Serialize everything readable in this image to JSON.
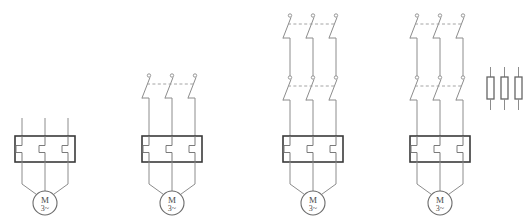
{
  "diagram": {
    "type": "electrical-schematic",
    "background_color": "#ffffff",
    "wire_color": "#8c8c8c",
    "box_color": "#3a3a3a",
    "fuse_color": "#666666",
    "canvas": {
      "width": 525,
      "height": 221
    },
    "phase_count": 3,
    "groups": [
      {
        "id": "circuit-1",
        "label": "Circuit 1",
        "center_x": 45,
        "phase_x": [
          22,
          45,
          68
        ],
        "line_top_y": 118,
        "switch_rows": [],
        "relay": {
          "x": 15,
          "y": 136,
          "width": 60,
          "height": 26
        },
        "motor": {
          "cx": 45,
          "cy": 203,
          "r": 12,
          "top_label": "M",
          "bottom_label": "3~"
        },
        "fuses": []
      },
      {
        "id": "circuit-2",
        "label": "Circuit 2",
        "center_x": 172,
        "phase_x": [
          149,
          172,
          195
        ],
        "line_top_y": 74,
        "switch_rows": [
          {
            "contact_y": 80,
            "blade_bottom_y": 98
          }
        ],
        "relay": {
          "x": 142,
          "y": 136,
          "width": 60,
          "height": 26
        },
        "motor": {
          "cx": 172,
          "cy": 203,
          "r": 12,
          "top_label": "M",
          "bottom_label": "3~"
        },
        "fuses": []
      },
      {
        "id": "circuit-3",
        "label": "Circuit 3",
        "center_x": 313,
        "phase_x": [
          290,
          313,
          336
        ],
        "line_top_y": 14,
        "switch_rows": [
          {
            "contact_y": 20,
            "blade_bottom_y": 38
          },
          {
            "contact_y": 82,
            "blade_bottom_y": 100
          }
        ],
        "relay": {
          "x": 283,
          "y": 136,
          "width": 60,
          "height": 26
        },
        "motor": {
          "cx": 313,
          "cy": 203,
          "r": 12,
          "top_label": "M",
          "bottom_label": "3~"
        },
        "fuses": []
      },
      {
        "id": "circuit-4",
        "label": "Circuit 4",
        "center_x": 440,
        "phase_x": [
          417,
          440,
          463
        ],
        "line_top_y": 14,
        "switch_rows": [
          {
            "contact_y": 20,
            "blade_bottom_y": 38
          },
          {
            "contact_y": 82,
            "blade_bottom_y": 100
          }
        ],
        "relay": {
          "x": 410,
          "y": 136,
          "width": 60,
          "height": 26
        },
        "motor": {
          "cx": 440,
          "cy": 203,
          "r": 12,
          "top_label": "M",
          "bottom_label": "3~"
        },
        "fuses": [
          {
            "x": 487,
            "y": 77,
            "width": 7,
            "height": 22,
            "lead_top_y": 67,
            "lead_bottom_y": 110
          },
          {
            "x": 501,
            "y": 77,
            "width": 7,
            "height": 22,
            "lead_top_y": 67,
            "lead_bottom_y": 110
          },
          {
            "x": 515,
            "y": 77,
            "width": 7,
            "height": 22,
            "lead_top_y": 67,
            "lead_bottom_y": 110
          }
        ]
      }
    ],
    "symbol_names": {
      "motor": "three-phase-motor",
      "relay": "thermal-overload-relay",
      "switch": "three-pole-contact-set",
      "fuse": "fuse"
    }
  }
}
